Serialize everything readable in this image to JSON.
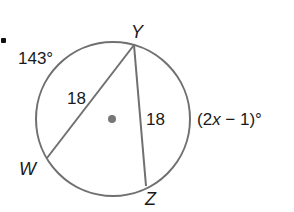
{
  "diagram": {
    "type": "circle-chords",
    "colors": {
      "stroke": "#707070",
      "text": "#1a1a1a",
      "center": "#777777",
      "background": "#ffffff"
    },
    "circle": {
      "cx": 113,
      "cy": 119,
      "r": 77
    },
    "points": {
      "Y": {
        "label": "Y",
        "x": 134,
        "y": 45
      },
      "W": {
        "label": "W",
        "x": 47,
        "y": 158
      },
      "Z": {
        "label": "Z",
        "x": 146,
        "y": 186
      }
    },
    "chords": [
      {
        "from": "Y",
        "to": "W",
        "length_label": "18"
      },
      {
        "from": "Y",
        "to": "Z",
        "length_label": "18"
      }
    ],
    "arcs": [
      {
        "name": "arc-WY",
        "label": "143°"
      },
      {
        "name": "arc-YZ",
        "label": "(2x − 1)°"
      }
    ],
    "labels": {
      "arc_wy": "143°",
      "chord_yw": "18",
      "chord_yz": "18",
      "arc_yz_prefix": "(2",
      "arc_yz_var": "x",
      "arc_yz_suffix": " − 1)°",
      "point_y": "Y",
      "point_w": "W",
      "point_z": "Z"
    }
  }
}
